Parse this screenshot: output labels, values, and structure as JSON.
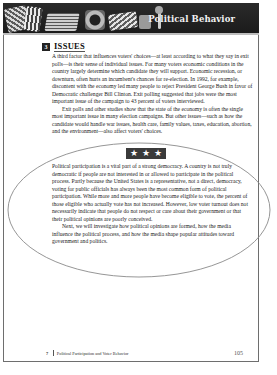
{
  "header": {
    "title": "Political Behavior",
    "collage_icons": [
      "newspaper-icon",
      "newspaper-icon",
      "newspaper-icon",
      "radio-icon",
      "newspaper-icon",
      "television-icon",
      "microphone-icon"
    ]
  },
  "section": {
    "number": "3",
    "title": "ISSUES",
    "paragraphs": [
      "A third factor that influences voters' choices—at least according to what they say in exit polls—is their sense of individual issues. For many voters economic conditions in the country largely determine which candidate they will support. Economic recession, or downturn, often hurts an incumbent's chances for re-election. In 1992, for example, discontent with the economy led many people to reject President George Bush in favor of Democratic challenger Bill Clinton. Exit polling suggested that jobs were the most important issue of the campaign to 43 percent of voters interviewed.",
      "Exit polls and other studies show that the state of the economy is often the single most important issue in many election campaigns. But other issues—such as how the candidate would handle war issues, health care, family values, taxes, education, abortion, and the environment—also affect voters' choices."
    ]
  },
  "divider": {
    "stars": [
      "★",
      "★",
      "★"
    ]
  },
  "summary": {
    "paragraphs": [
      "Political participation is a vital part of a strong democracy. A country is not truly democratic if people are not interested in or allowed to participate in the political process. Partly because the United States is a representative, not a direct, democracy, voting for public officials has always been the most common form of political participation. While more and more people have become eligible to vote, the percent of those eligible who actually vote has not increased. However, low voter turnout does not necessarily indicate that people do not respect or care about their government or that their political opinions are poorly conceived.",
      "Next, we will investigate how political opinions are formed, how the media influence the political process, and how the media shape popular attitudes toward government and politics."
    ]
  },
  "footer": {
    "chapter_number": "7",
    "chapter_title": "Political Participation and Voter Behavior",
    "page_number": "105"
  },
  "colors": {
    "banner": "#1f1f1f",
    "border": "#6e6e6e",
    "ellipse": "#8a8a8a",
    "text": "#222222"
  }
}
